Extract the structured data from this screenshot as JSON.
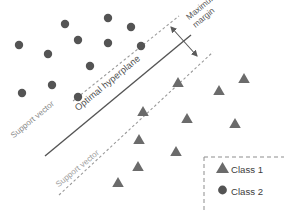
{
  "figure": {
    "width": 284,
    "height": 210,
    "background": "#ffffff"
  },
  "colors": {
    "class1_triangle": "#6b6b6b",
    "class2_circle": "#545454",
    "hyperplane_line": "#555555",
    "margin_dashed": "#9a9a9a",
    "legend_border": "#8d8d8d",
    "text": "#3c3c3c"
  },
  "annotations": {
    "optimal_hyperplane": "Optimal hyperplane",
    "support_vector_upper": "Support vector",
    "support_vector_lower": "Support vector",
    "maximum_margin_line1": "Maximum",
    "maximum_margin_line2": "margin"
  },
  "legend": {
    "items": [
      {
        "marker": "triangle-icon",
        "label": "Class 1"
      },
      {
        "marker": "circle-icon",
        "label": "Class 2"
      }
    ]
  },
  "chart_data": {
    "type": "scatter",
    "xlabel": "",
    "ylabel": "",
    "xlim": [
      0,
      284
    ],
    "ylim": [
      0,
      210
    ],
    "grid": false,
    "legend_position": "bottom-right",
    "series": [
      {
        "name": "Class 2",
        "marker": "circle",
        "color": "#545454",
        "radius": 4.2,
        "points": [
          [
            65,
            24
          ],
          [
            108,
            18
          ],
          [
            131,
            27
          ],
          [
            78,
            40
          ],
          [
            19,
            45
          ],
          [
            108,
            43
          ],
          [
            48,
            54
          ],
          [
            141,
            46
          ],
          [
            90,
            66
          ],
          [
            52,
            85
          ],
          [
            22,
            93
          ],
          [
            78,
            97
          ]
        ]
      },
      {
        "name": "Class 1",
        "marker": "triangle",
        "color": "#6b6b6b",
        "size": 10,
        "points": [
          [
            244,
            78
          ],
          [
            178,
            82
          ],
          [
            219,
            90
          ],
          [
            143,
            111
          ],
          [
            187,
            118
          ],
          [
            235,
            123
          ],
          [
            139,
            139
          ],
          [
            176,
            151
          ],
          [
            138,
            166
          ],
          [
            118,
            182
          ]
        ]
      }
    ],
    "lines": [
      {
        "name": "optimal-hyperplane",
        "style": "solid",
        "color": "#555555",
        "width": 1.4,
        "x1": 45,
        "y1": 156,
        "x2": 191,
        "y2": 35
      },
      {
        "name": "upper-margin-boundary",
        "style": "dashed",
        "color": "#9a9a9a",
        "width": 1.1,
        "x1": 73,
        "y1": 101,
        "x2": 179,
        "y2": 16
      },
      {
        "name": "lower-margin-boundary",
        "style": "dashed",
        "color": "#9a9a9a",
        "width": 1.1,
        "x1": 59,
        "y1": 195,
        "x2": 213,
        "y2": 52
      }
    ],
    "margin_arrow": {
      "name": "maximum-margin-arrow",
      "double_headed": true,
      "color": "#5a5a5a",
      "x1": 171,
      "y1": 27,
      "x2": 197,
      "y2": 56
    }
  }
}
